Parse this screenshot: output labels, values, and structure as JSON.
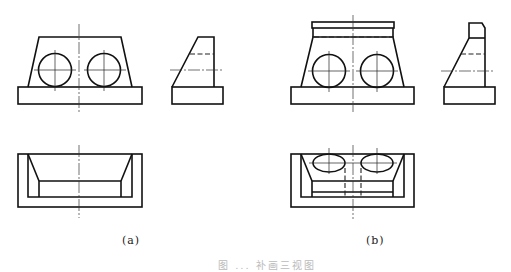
{
  "figure": {
    "caption": "图 ... 补画三视图",
    "caption_visible": "partially clipped / illegible at bottom edge",
    "line_color": "#111111",
    "background": "#ffffff"
  },
  "panels": [
    {
      "id": "a",
      "label": "(a)",
      "views": [
        "front-view",
        "left-side-view",
        "top-view"
      ],
      "front_view": {
        "base": "rectangle",
        "body": "trapezoid",
        "holes": 2
      },
      "side_view": {
        "profile": "sloped wedge on base",
        "hidden_lines": 1
      },
      "top_view": {
        "profile": "rectangle with tapered pocket"
      }
    },
    {
      "id": "b",
      "label": "(b)",
      "views": [
        "front-view",
        "left-side-view",
        "top-view"
      ],
      "front_view": {
        "base": "rectangle",
        "body": "trapezoid with top lip",
        "holes": 2,
        "hidden_lines": 1
      },
      "side_view": {
        "profile": "sloped wedge with chamfered top block",
        "hidden_lines": 1
      },
      "top_view": {
        "profile": "rectangle with tapered pocket and elliptical hole outlines",
        "holes": 2
      }
    }
  ]
}
